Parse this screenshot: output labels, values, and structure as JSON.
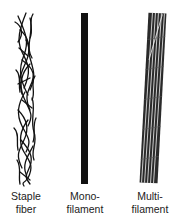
{
  "figure": {
    "items": [
      {
        "id": "staple-fiber",
        "label_line1": "Staple",
        "label_line2": "fiber",
        "style": "tangled short fibers"
      },
      {
        "id": "monofilament",
        "label_line1": "Mono-",
        "label_line2": "filament",
        "style": "single solid strand"
      },
      {
        "id": "multifilament",
        "label_line1": "Multi-",
        "label_line2": "filament",
        "style": "bundle of parallel twisted filaments"
      }
    ],
    "colors": {
      "ink": "#111111",
      "background": "#ffffff",
      "label": "#222222"
    }
  }
}
